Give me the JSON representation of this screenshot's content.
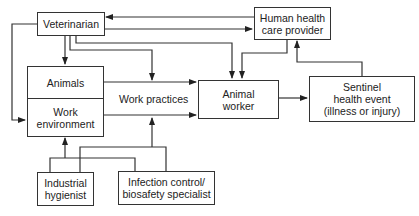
{
  "diagram": {
    "nodes": {
      "veterinarian": {
        "label": "Veterinarian"
      },
      "human_health": {
        "line1": "Human health",
        "line2": "care provider"
      },
      "animals": {
        "label": "Animals"
      },
      "work_environment": {
        "line1": "Work",
        "line2": "environment"
      },
      "work_practices": {
        "label": "Work practices"
      },
      "animal_worker": {
        "line1": "Animal",
        "line2": "worker"
      },
      "sentinel": {
        "line1": "Sentinel",
        "line2": "health event",
        "line3": "(illness or injury)"
      },
      "industrial_hygienist": {
        "line1": "Industrial",
        "line2": "hygienist"
      },
      "infection_control": {
        "line1": "Infection control/",
        "line2": "biosafety specialist"
      }
    },
    "edges": [
      {
        "from": "Human health care provider",
        "to": "Veterinarian"
      },
      {
        "from": "Veterinarian",
        "to": "Human health care provider"
      },
      {
        "from": "Veterinarian",
        "to": "Animals"
      },
      {
        "from": "Veterinarian",
        "to": "Work environment"
      },
      {
        "from": "Veterinarian",
        "to": "Work practices"
      },
      {
        "from": "Veterinarian",
        "to": "Animal worker"
      },
      {
        "from": "Human health care provider",
        "to": "Animal worker"
      },
      {
        "from": "Animals",
        "to": "Animal worker"
      },
      {
        "from": "Work environment",
        "to": "Animal worker"
      },
      {
        "from": "Animal worker",
        "to": "Sentinel health event"
      },
      {
        "from": "Sentinel health event",
        "to": "Human health care provider"
      },
      {
        "from": "Industrial hygienist",
        "to": "Work environment"
      },
      {
        "from": "Industrial hygienist",
        "to": "Work practices"
      },
      {
        "from": "Infection control/biosafety specialist",
        "to": "Work environment"
      },
      {
        "from": "Infection control/biosafety specialist",
        "to": "Work practices"
      }
    ],
    "colors": {
      "line": "#333333",
      "background": "#ffffff"
    }
  }
}
